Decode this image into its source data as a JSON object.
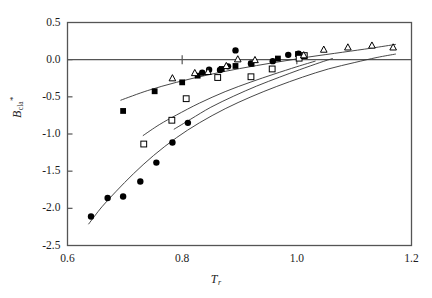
{
  "chart_data": {
    "type": "scatter",
    "title": "",
    "subtitle": "",
    "xlabel": "T",
    "xlabel_sub": "r",
    "ylabel": "B",
    "ylabel_sub": "cla",
    "ylabel_sup": "*",
    "xlim": [
      0.6,
      1.2
    ],
    "ylim": [
      -2.5,
      0.5
    ],
    "xticks": [
      "0.6",
      "0.8",
      "1.0",
      "1.2"
    ],
    "xtick_values": [
      0.6,
      0.8,
      1.0,
      1.2
    ],
    "yticks": [
      "0.5",
      "0.0",
      "-0.5",
      "-1.0",
      "-1.5",
      "-2.0",
      "-2.5"
    ],
    "ytick_values": [
      0.5,
      0.0,
      -0.5,
      -1.0,
      -1.5,
      -2.0,
      -2.5
    ],
    "grid": false,
    "legend": "none",
    "zero_line": true,
    "axis_color": "#555555",
    "marker_color": "#000000",
    "curve_color": "#333333",
    "series": [
      {
        "name": "filled-circle-series",
        "marker": "filled-circle",
        "points": [
          {
            "x": 0.641,
            "y": -2.11
          },
          {
            "x": 0.67,
            "y": -1.86
          },
          {
            "x": 0.697,
            "y": -1.84
          },
          {
            "x": 0.727,
            "y": -1.64
          },
          {
            "x": 0.755,
            "y": -1.385
          },
          {
            "x": 0.783,
            "y": -1.115
          },
          {
            "x": 0.81,
            "y": -0.85
          },
          {
            "x": 0.835,
            "y": -0.175
          },
          {
            "x": 0.847,
            "y": -0.135
          },
          {
            "x": 0.866,
            "y": -0.14
          },
          {
            "x": 0.88,
            "y": -0.09
          },
          {
            "x": 0.893,
            "y": 0.125
          },
          {
            "x": 0.92,
            "y": -0.05
          },
          {
            "x": 0.958,
            "y": -0.02
          },
          {
            "x": 0.985,
            "y": 0.065
          },
          {
            "x": 1.003,
            "y": 0.08
          }
        ]
      },
      {
        "name": "filled-square-series",
        "marker": "filled-square",
        "points": [
          {
            "x": 0.697,
            "y": -0.69
          },
          {
            "x": 0.752,
            "y": -0.425
          },
          {
            "x": 0.8,
            "y": -0.305
          },
          {
            "x": 0.827,
            "y": -0.215
          },
          {
            "x": 0.869,
            "y": -0.125
          },
          {
            "x": 0.893,
            "y": -0.085
          },
          {
            "x": 0.921,
            "y": -0.055
          },
          {
            "x": 0.967,
            "y": 0.015
          },
          {
            "x": 1.002,
            "y": 0.075
          }
        ]
      },
      {
        "name": "open-square-series",
        "marker": "open-square",
        "points": [
          {
            "x": 0.733,
            "y": -1.135
          },
          {
            "x": 0.782,
            "y": -0.815
          },
          {
            "x": 0.807,
            "y": -0.525
          },
          {
            "x": 0.862,
            "y": -0.24
          },
          {
            "x": 0.92,
            "y": -0.23
          },
          {
            "x": 0.957,
            "y": -0.125
          },
          {
            "x": 1.004,
            "y": 0.02
          },
          {
            "x": 1.013,
            "y": 0.055
          }
        ]
      },
      {
        "name": "open-triangle-series",
        "marker": "open-triangle",
        "points": [
          {
            "x": 0.783,
            "y": -0.25
          },
          {
            "x": 0.822,
            "y": -0.18
          },
          {
            "x": 0.845,
            "y": -0.165
          },
          {
            "x": 0.877,
            "y": -0.085
          },
          {
            "x": 0.897,
            "y": 0.005
          },
          {
            "x": 0.927,
            "y": -0.005
          },
          {
            "x": 1.012,
            "y": 0.06
          },
          {
            "x": 1.047,
            "y": 0.135
          },
          {
            "x": 1.089,
            "y": 0.165
          },
          {
            "x": 1.131,
            "y": 0.19
          },
          {
            "x": 1.168,
            "y": 0.165
          }
        ]
      }
    ],
    "curves": [
      {
        "name": "upper-fit-curve",
        "points": [
          {
            "x": 0.693,
            "y": -0.545
          },
          {
            "x": 0.74,
            "y": -0.415
          },
          {
            "x": 0.79,
            "y": -0.305
          },
          {
            "x": 0.845,
            "y": -0.205
          },
          {
            "x": 0.9,
            "y": -0.12
          },
          {
            "x": 0.96,
            "y": -0.04
          },
          {
            "x": 1.02,
            "y": 0.035
          },
          {
            "x": 1.08,
            "y": 0.1
          },
          {
            "x": 1.13,
            "y": 0.155
          },
          {
            "x": 1.172,
            "y": 0.205
          }
        ]
      },
      {
        "name": "middle-fit-curve",
        "points": [
          {
            "x": 0.732,
            "y": -1.02
          },
          {
            "x": 0.76,
            "y": -0.875
          },
          {
            "x": 0.79,
            "y": -0.745
          },
          {
            "x": 0.83,
            "y": -0.585
          },
          {
            "x": 0.875,
            "y": -0.43
          },
          {
            "x": 0.92,
            "y": -0.3
          },
          {
            "x": 0.96,
            "y": -0.195
          },
          {
            "x": 1.0,
            "y": -0.095
          },
          {
            "x": 1.032,
            "y": -0.02
          }
        ]
      },
      {
        "name": "lower-fit-curve",
        "points": [
          {
            "x": 0.786,
            "y": -0.935
          },
          {
            "x": 0.815,
            "y": -0.8
          },
          {
            "x": 0.85,
            "y": -0.64
          },
          {
            "x": 0.89,
            "y": -0.49
          },
          {
            "x": 0.93,
            "y": -0.355
          },
          {
            "x": 0.97,
            "y": -0.235
          },
          {
            "x": 1.005,
            "y": -0.135
          },
          {
            "x": 1.04,
            "y": -0.04
          },
          {
            "x": 1.062,
            "y": 0.015
          }
        ]
      },
      {
        "name": "circle-fit-curve",
        "points": [
          {
            "x": 0.637,
            "y": -2.21
          },
          {
            "x": 0.66,
            "y": -1.98
          },
          {
            "x": 0.685,
            "y": -1.77
          },
          {
            "x": 0.715,
            "y": -1.535
          },
          {
            "x": 0.75,
            "y": -1.29
          },
          {
            "x": 0.79,
            "y": -1.05
          },
          {
            "x": 0.83,
            "y": -0.85
          },
          {
            "x": 0.875,
            "y": -0.66
          },
          {
            "x": 0.92,
            "y": -0.5
          },
          {
            "x": 0.965,
            "y": -0.36
          },
          {
            "x": 1.01,
            "y": -0.235
          },
          {
            "x": 1.055,
            "y": -0.125
          },
          {
            "x": 1.1,
            "y": -0.04
          },
          {
            "x": 1.14,
            "y": 0.03
          },
          {
            "x": 1.172,
            "y": 0.075
          }
        ]
      }
    ]
  }
}
